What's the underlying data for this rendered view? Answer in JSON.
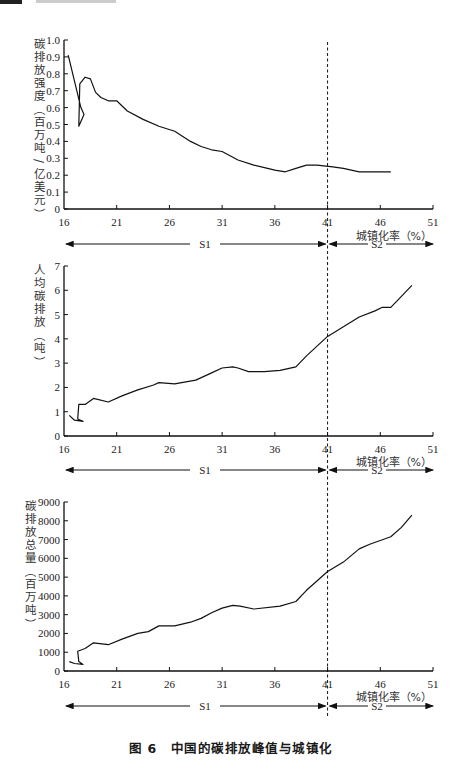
{
  "figure": {
    "caption_number": "图 6",
    "caption_text": "中国的碳排放峰值与城镇化",
    "divider_x": 41,
    "stage_labels": [
      "S1",
      "S2"
    ]
  },
  "chart_data": [
    {
      "type": "line",
      "title": "",
      "xlabel": "城镇化率（%）",
      "ylabel": "碳排放强度（百万吨/亿美元）",
      "xlim": [
        16,
        51
      ],
      "ylim": [
        0,
        1.0
      ],
      "xticks": [
        16,
        21,
        26,
        31,
        36,
        41,
        46,
        51
      ],
      "yticks": [
        "0",
        "0.1",
        "0.2",
        "0.3",
        "0.4",
        "0.5",
        "0.6",
        "0.7",
        "0.8",
        "0.9",
        "1.0"
      ],
      "grid": false,
      "x": [
        16.4,
        17.6,
        17.9,
        17.4,
        17.5,
        18.0,
        18.5,
        19.0,
        19.5,
        20.2,
        21.0,
        22.0,
        23.5,
        25.0,
        26.5,
        28.0,
        29.0,
        30.0,
        31.0,
        32.5,
        34.0,
        36.0,
        37.0,
        38.0,
        39.0,
        40.0,
        41.5,
        42.5,
        44.0,
        45.0,
        46.0,
        47.0
      ],
      "y": [
        0.91,
        0.6,
        0.56,
        0.49,
        0.74,
        0.78,
        0.77,
        0.69,
        0.66,
        0.64,
        0.64,
        0.58,
        0.53,
        0.49,
        0.46,
        0.4,
        0.37,
        0.35,
        0.34,
        0.29,
        0.26,
        0.23,
        0.22,
        0.24,
        0.26,
        0.26,
        0.25,
        0.24,
        0.22,
        0.22,
        0.22,
        0.22
      ]
    },
    {
      "type": "line",
      "title": "",
      "xlabel": "城镇化率（%）",
      "ylabel": "人均碳排放（吨）",
      "xlim": [
        16,
        51
      ],
      "ylim": [
        0,
        7
      ],
      "xticks": [
        16,
        21,
        26,
        31,
        36,
        41,
        46,
        51
      ],
      "yticks": [
        "0",
        "1",
        "2",
        "3",
        "4",
        "5",
        "6",
        "7"
      ],
      "grid": false,
      "x": [
        16.5,
        17.0,
        17.8,
        17.3,
        17.4,
        18.0,
        18.8,
        20.2,
        21.5,
        23.0,
        24.5,
        25.0,
        26.5,
        28.5,
        30.0,
        31.0,
        32.0,
        32.5,
        33.5,
        35.0,
        36.5,
        38.0,
        39.0,
        41.0,
        42.5,
        44.0,
        45.5,
        46.2,
        47.0,
        48.0,
        49.0
      ],
      "y": [
        0.85,
        0.65,
        0.6,
        0.7,
        1.3,
        1.3,
        1.55,
        1.4,
        1.65,
        1.9,
        2.1,
        2.2,
        2.15,
        2.3,
        2.6,
        2.8,
        2.85,
        2.8,
        2.65,
        2.65,
        2.7,
        2.85,
        3.3,
        4.1,
        4.5,
        4.9,
        5.15,
        5.3,
        5.3,
        5.75,
        6.2
      ]
    },
    {
      "type": "line",
      "title": "",
      "xlabel": "城镇化率（%）",
      "ylabel": "碳排放总量（百万吨）",
      "xlim": [
        16,
        51
      ],
      "ylim": [
        0,
        9000
      ],
      "xticks": [
        16,
        21,
        26,
        31,
        36,
        41,
        46,
        51
      ],
      "yticks": [
        "0",
        "1000",
        "2000",
        "3000",
        "4000",
        "5000",
        "6000",
        "7000",
        "8000",
        "9000"
      ],
      "grid": false,
      "x": [
        16.5,
        17.0,
        17.8,
        17.4,
        17.3,
        18.0,
        18.8,
        20.2,
        21.5,
        23.0,
        24.0,
        25.0,
        26.5,
        28.0,
        29.0,
        30.0,
        31.0,
        32.0,
        32.7,
        34.0,
        36.5,
        38.0,
        39.0,
        41.0,
        42.5,
        44.0,
        45.0,
        46.0,
        47.0,
        48.0,
        49.0
      ],
      "y": [
        500,
        400,
        350,
        500,
        1050,
        1200,
        1500,
        1400,
        1700,
        2000,
        2100,
        2400,
        2400,
        2600,
        2800,
        3100,
        3350,
        3500,
        3450,
        3300,
        3450,
        3700,
        4300,
        5300,
        5800,
        6500,
        6750,
        6950,
        7150,
        7650,
        8300
      ]
    }
  ]
}
